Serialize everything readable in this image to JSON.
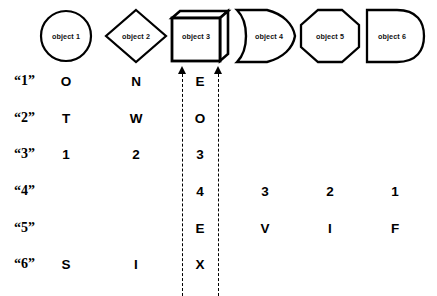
{
  "canvas": {
    "width": 437,
    "height": 296,
    "background": "#ffffff",
    "ink": "#000000"
  },
  "header": {
    "columns": [
      {
        "id": "object-1",
        "label": "object 1",
        "shape": "circle",
        "center_x": 66,
        "width": 58,
        "height": 52
      },
      {
        "id": "object-2",
        "label": "object 2",
        "shape": "diamond",
        "center_x": 136,
        "width": 62,
        "height": 54
      },
      {
        "id": "object-3",
        "label": "object 3",
        "shape": "cube-3d",
        "center_x": 200,
        "width": 60,
        "height": 54
      },
      {
        "id": "object-4",
        "label": "object 4",
        "shape": "shield-arrow",
        "center_x": 265,
        "width": 62,
        "height": 54
      },
      {
        "id": "object-5",
        "label": "object 5",
        "shape": "octagon",
        "center_x": 330,
        "width": 58,
        "height": 52
      },
      {
        "id": "object-6",
        "label": "object 6",
        "shape": "d-shape",
        "center_x": 395,
        "width": 58,
        "height": 52
      }
    ]
  },
  "grid": {
    "row_labels": [
      "“1”",
      "“2”",
      "“3”",
      "“4”",
      "“5”",
      "“6”"
    ],
    "row_label_x": 14,
    "row_centers_y": [
      82,
      119,
      155,
      192,
      229,
      265
    ],
    "column_centers_x": [
      66,
      136,
      200,
      265,
      330,
      395
    ],
    "rows": [
      {
        "label": "“1”",
        "cells": [
          "O",
          "N",
          "E",
          "",
          "",
          ""
        ]
      },
      {
        "label": "“2”",
        "cells": [
          "T",
          "W",
          "O",
          "",
          "",
          ""
        ]
      },
      {
        "label": "“3”",
        "cells": [
          "1",
          "2",
          "3",
          "",
          "",
          ""
        ]
      },
      {
        "label": "“4”",
        "cells": [
          "",
          "",
          "4",
          "3",
          "2",
          "1"
        ]
      },
      {
        "label": "“5”",
        "cells": [
          "",
          "",
          "E",
          "V",
          "I",
          "F"
        ]
      },
      {
        "label": "“6”",
        "cells": [
          "S",
          "I",
          "X",
          "",
          "",
          ""
        ]
      }
    ]
  },
  "guides": {
    "description": "two vertical dashed guide lines with upward arrowheads flanking the object 3 column",
    "lines": [
      {
        "id": "guide-left",
        "x": 182,
        "top": 74,
        "bottom": 296
      },
      {
        "id": "guide-right",
        "x": 218,
        "top": 74,
        "bottom": 296
      }
    ],
    "arrows": [
      {
        "id": "arrow-left",
        "x": 182,
        "y": 66
      },
      {
        "id": "arrow-right",
        "x": 218,
        "y": 66
      }
    ]
  }
}
